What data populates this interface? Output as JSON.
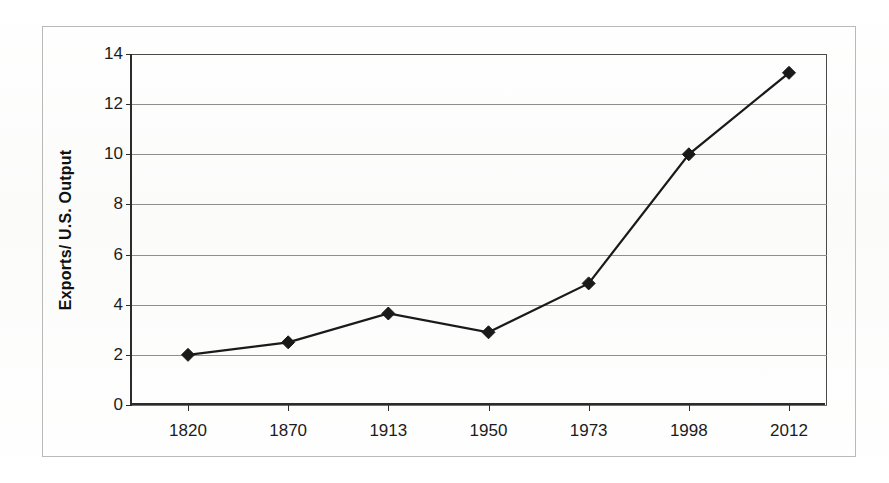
{
  "figure": {
    "frame_color": "#b9b9b9",
    "background_color": "#ffffff"
  },
  "chart_data": {
    "type": "line",
    "title": "",
    "xlabel": "",
    "ylabel": "Exports/ U.S. Output",
    "categories": [
      "1820",
      "1870",
      "1913",
      "1950",
      "1973",
      "1998",
      "2012"
    ],
    "values": [
      2.0,
      2.5,
      3.65,
      2.9,
      4.85,
      10.0,
      13.25
    ],
    "series": [
      {
        "name": "Exports/ U.S. Output",
        "values": [
          2.0,
          2.5,
          3.65,
          2.9,
          4.85,
          10.0,
          13.25
        ]
      }
    ],
    "ylim": [
      0,
      14
    ],
    "yticks": [
      "0",
      "2",
      "4",
      "6",
      "8",
      "10",
      "12",
      "14"
    ],
    "ytick_values": [
      0,
      2,
      4,
      6,
      8,
      10,
      12,
      14
    ],
    "xtick_labels": [
      "1820",
      "1870",
      "1913",
      "1950",
      "1973",
      "1998",
      "2012"
    ],
    "grid": true,
    "grid_axis": "y",
    "legend": false,
    "legend_position": "none",
    "marker": "diamond",
    "line_color": "#1a1a1a",
    "marker_color": "#1a1a1a",
    "annotations": []
  }
}
